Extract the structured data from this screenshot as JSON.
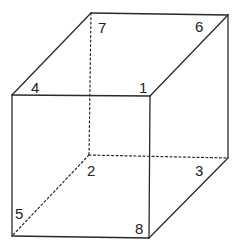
{
  "diagram": {
    "stroke_color": "#2a2a2a",
    "label_color": "#222222",
    "vertices": [
      {
        "id": "1",
        "x": 150,
        "y": 96,
        "label": "1",
        "lx": 139,
        "ly": 93
      },
      {
        "id": "2",
        "x": 89,
        "y": 155,
        "label": "2",
        "lx": 87,
        "ly": 176
      },
      {
        "id": "3",
        "x": 228,
        "y": 158,
        "label": "3",
        "lx": 195,
        "ly": 176
      },
      {
        "id": "4",
        "x": 12,
        "y": 95,
        "label": "4",
        "lx": 31,
        "ly": 93
      },
      {
        "id": "5",
        "x": 12,
        "y": 236,
        "label": "5",
        "lx": 15,
        "ly": 219
      },
      {
        "id": "6",
        "x": 228,
        "y": 15,
        "label": "6",
        "lx": 195,
        "ly": 32
      },
      {
        "id": "7",
        "x": 91,
        "y": 13,
        "label": "7",
        "lx": 98,
        "ly": 33
      },
      {
        "id": "8",
        "x": 149,
        "y": 238,
        "label": "8",
        "lx": 135,
        "ly": 234
      }
    ],
    "edges": [
      {
        "from": "4",
        "to": "1",
        "hidden": false
      },
      {
        "from": "4",
        "to": "7",
        "hidden": false
      },
      {
        "from": "7",
        "to": "6",
        "hidden": false
      },
      {
        "from": "1",
        "to": "6",
        "hidden": false
      },
      {
        "from": "4",
        "to": "5",
        "hidden": false
      },
      {
        "from": "1",
        "to": "8",
        "hidden": false
      },
      {
        "from": "6",
        "to": "3",
        "hidden": false
      },
      {
        "from": "5",
        "to": "8",
        "hidden": false
      },
      {
        "from": "8",
        "to": "3",
        "hidden": false
      },
      {
        "from": "7",
        "to": "2",
        "hidden": true
      },
      {
        "from": "2",
        "to": "3",
        "hidden": true
      },
      {
        "from": "2",
        "to": "5",
        "hidden": true
      }
    ]
  }
}
